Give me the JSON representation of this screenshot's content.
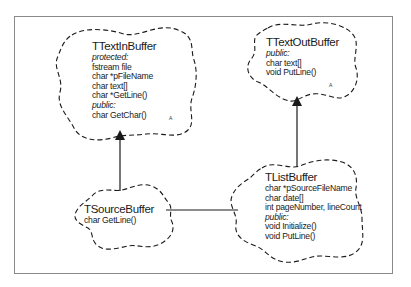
{
  "diagram": {
    "type": "class-hierarchy",
    "classes": [
      {
        "id": "TTextInBuffer",
        "name": "TTextInBuffer",
        "lines": [
          {
            "text": "protected:",
            "kind": "keyword"
          },
          {
            "text": "fstream file",
            "kind": "member"
          },
          {
            "text": "char *pFileName",
            "kind": "member"
          },
          {
            "text": "char text[]",
            "kind": "member"
          },
          {
            "text": "char *GetLine()",
            "kind": "member"
          },
          {
            "text": "public:",
            "kind": "keyword"
          },
          {
            "text": "char GetChar()",
            "kind": "member"
          }
        ],
        "marker": "A"
      },
      {
        "id": "TTextOutBuffer",
        "name": "TTextOutBuffer",
        "lines": [
          {
            "text": "public:",
            "kind": "keyword"
          },
          {
            "text": "char text[]",
            "kind": "member"
          },
          {
            "text": "void PutLine()",
            "kind": "member"
          }
        ],
        "marker": "A"
      },
      {
        "id": "TSourceBuffer",
        "name": "TSourceBuffer",
        "lines": [
          {
            "text": "char GetLine()",
            "kind": "member"
          }
        ]
      },
      {
        "id": "TListBuffer",
        "name": "TListBuffer",
        "lines": [
          {
            "text": "char *pSourceFileName",
            "kind": "member"
          },
          {
            "text": "char date[]",
            "kind": "member"
          },
          {
            "text": "int pageNumber, lineCount",
            "kind": "member"
          },
          {
            "text": "public:",
            "kind": "keyword"
          },
          {
            "text": "void Initialize()",
            "kind": "member"
          },
          {
            "text": "void PutLine()",
            "kind": "member"
          }
        ]
      }
    ],
    "relationships": [
      {
        "from": "TSourceBuffer",
        "to": "TTextInBuffer",
        "type": "inheritance"
      },
      {
        "from": "TListBuffer",
        "to": "TTextOutBuffer",
        "type": "inheritance"
      },
      {
        "from": "TSourceBuffer",
        "to": "TListBuffer",
        "type": "association"
      }
    ],
    "colors": {
      "line": "#1a1a1a",
      "frame": "#8a8a8a",
      "background": "#ffffff"
    }
  }
}
